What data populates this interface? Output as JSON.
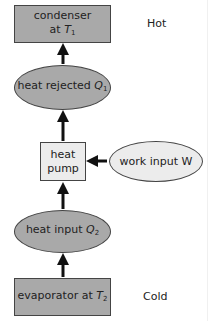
{
  "diagram": {
    "nodes": {
      "condenser": {
        "line1": "condenser",
        "line2_prefix": "at ",
        "var": "T",
        "sub": "1"
      },
      "heat_rejected": {
        "prefix": "heat rejected ",
        "var": "Q",
        "sub": "1"
      },
      "heat_pump": {
        "line1": "heat",
        "line2": "pump"
      },
      "work_input": {
        "prefix": "work input ",
        "var": "W"
      },
      "heat_input": {
        "prefix": "heat input ",
        "var": "Q",
        "sub": "2"
      },
      "evaporator": {
        "prefix": "evaporator at ",
        "var": "T",
        "sub": "2"
      }
    },
    "labels": {
      "hot": "Hot",
      "cold": "Cold"
    },
    "edges": [
      {
        "from": "evaporator",
        "to": "heat_input"
      },
      {
        "from": "heat_input",
        "to": "heat_pump"
      },
      {
        "from": "work_input",
        "to": "heat_pump"
      },
      {
        "from": "heat_pump",
        "to": "heat_rejected"
      },
      {
        "from": "heat_rejected",
        "to": "condenser"
      }
    ],
    "colors": {
      "fill_dark": "#a9a9a9",
      "fill_light": "#ececec",
      "stroke": "#444444"
    }
  }
}
